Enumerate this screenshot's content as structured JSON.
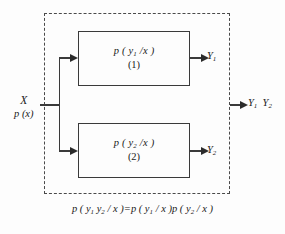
{
  "diagram": {
    "background_color": "#fdfdfd",
    "line_color": "#3a3a3a",
    "dashed_border_color": "#4a4a4a",
    "input": {
      "source_label": "X",
      "distribution_label": "p (x)"
    },
    "boxes": [
      {
        "formula": "p ( y₁ /x )",
        "formula_base": "p ( y",
        "formula_sub": "1",
        "formula_tail": " /x )",
        "index": "(1)",
        "output_label": "Y",
        "output_sub": "1"
      },
      {
        "formula": "p ( y₂ /x )",
        "formula_base": "p ( y",
        "formula_sub": "2",
        "formula_tail": " /x )",
        "index": "(2)",
        "output_label": "Y",
        "output_sub": "2"
      }
    ],
    "combined_output": {
      "first": "Y",
      "first_sub": "1",
      "second": "Y",
      "second_sub": "2"
    },
    "equation": {
      "lhs_p": "p ( y",
      "lhs_sub1": "1",
      "lhs_mid": " y",
      "lhs_sub2": "2",
      "lhs_tail": " / x )",
      "equals": "=",
      "rhs1_p": "p ( y",
      "rhs1_sub": "1",
      "rhs1_tail": " / x )",
      "rhs2_p": "p ( y",
      "rhs2_sub": "2",
      "rhs2_tail": " / x )"
    }
  }
}
